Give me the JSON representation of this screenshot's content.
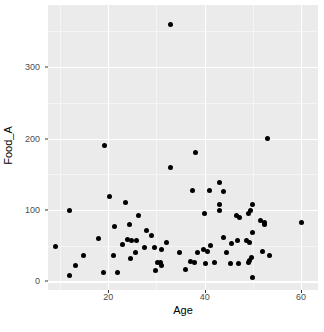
{
  "chart_data": {
    "type": "scatter",
    "title": "",
    "xlabel": "Age",
    "ylabel": "Food_A",
    "xlim": [
      7.5,
      63.5
    ],
    "ylim": [
      -12,
      387
    ],
    "grid": true,
    "legend": null,
    "x_ticks": [
      20,
      40,
      60
    ],
    "y_ticks": [
      0,
      100,
      200,
      300
    ],
    "x_tick_labels": [
      "20",
      "40",
      "60"
    ],
    "y_tick_labels": [
      "0",
      "100",
      "200",
      "300"
    ],
    "x_minor_ticks": [
      10,
      30,
      50
    ],
    "y_minor_ticks": [
      50,
      150,
      250,
      350
    ],
    "point_color": "#000000",
    "panel_color": "#EBEBEB",
    "grid_color": "#FFFFFF",
    "points": [
      {
        "x": 33.0,
        "y": 360
      },
      {
        "x": 53.0,
        "y": 200
      },
      {
        "x": 19.3,
        "y": 190
      },
      {
        "x": 38.0,
        "y": 180
      },
      {
        "x": 33.0,
        "y": 160
      },
      {
        "x": 43.0,
        "y": 138
      },
      {
        "x": 37.5,
        "y": 128
      },
      {
        "x": 41.0,
        "y": 128
      },
      {
        "x": 44.0,
        "y": 126
      },
      {
        "x": 20.2,
        "y": 119
      },
      {
        "x": 50.0,
        "y": 108
      },
      {
        "x": 23.5,
        "y": 110
      },
      {
        "x": 43.0,
        "y": 108
      },
      {
        "x": 12.0,
        "y": 100
      },
      {
        "x": 49.5,
        "y": 100
      },
      {
        "x": 43.0,
        "y": 100
      },
      {
        "x": 26.3,
        "y": 93
      },
      {
        "x": 40.0,
        "y": 95
      },
      {
        "x": 49.0,
        "y": 95
      },
      {
        "x": 46.5,
        "y": 93
      },
      {
        "x": 47.3,
        "y": 90
      },
      {
        "x": 51.5,
        "y": 85
      },
      {
        "x": 52.3,
        "y": 82
      },
      {
        "x": 60.0,
        "y": 82
      },
      {
        "x": 52.3,
        "y": 80
      },
      {
        "x": 24.5,
        "y": 80
      },
      {
        "x": 21.3,
        "y": 77
      },
      {
        "x": 28.0,
        "y": 72
      },
      {
        "x": 50.0,
        "y": 68
      },
      {
        "x": 29.0,
        "y": 65
      },
      {
        "x": 18.0,
        "y": 60
      },
      {
        "x": 24.0,
        "y": 59
      },
      {
        "x": 24.8,
        "y": 57
      },
      {
        "x": 25.8,
        "y": 57
      },
      {
        "x": 44.0,
        "y": 62
      },
      {
        "x": 46.8,
        "y": 58
      },
      {
        "x": 48.7,
        "y": 58
      },
      {
        "x": 49.3,
        "y": 55
      },
      {
        "x": 32.0,
        "y": 55
      },
      {
        "x": 23.0,
        "y": 52
      },
      {
        "x": 9.0,
        "y": 49
      },
      {
        "x": 41.3,
        "y": 50
      },
      {
        "x": 45.5,
        "y": 53
      },
      {
        "x": 27.5,
        "y": 48
      },
      {
        "x": 29.5,
        "y": 47
      },
      {
        "x": 31.0,
        "y": 45
      },
      {
        "x": 39.8,
        "y": 45
      },
      {
        "x": 40.5,
        "y": 42
      },
      {
        "x": 44.5,
        "y": 40
      },
      {
        "x": 25.7,
        "y": 40
      },
      {
        "x": 34.8,
        "y": 40
      },
      {
        "x": 38.5,
        "y": 40
      },
      {
        "x": 52.0,
        "y": 42
      },
      {
        "x": 14.8,
        "y": 37
      },
      {
        "x": 21.0,
        "y": 36
      },
      {
        "x": 53.5,
        "y": 36
      },
      {
        "x": 49.8,
        "y": 34
      },
      {
        "x": 24.7,
        "y": 32
      },
      {
        "x": 49.3,
        "y": 30
      },
      {
        "x": 49.0,
        "y": 27
      },
      {
        "x": 30.3,
        "y": 27
      },
      {
        "x": 30.8,
        "y": 26
      },
      {
        "x": 31.0,
        "y": 23
      },
      {
        "x": 37.0,
        "y": 28
      },
      {
        "x": 37.8,
        "y": 27
      },
      {
        "x": 40.2,
        "y": 25
      },
      {
        "x": 42.0,
        "y": 26
      },
      {
        "x": 45.3,
        "y": 25
      },
      {
        "x": 47.0,
        "y": 25
      },
      {
        "x": 13.3,
        "y": 23
      },
      {
        "x": 36.0,
        "y": 17
      },
      {
        "x": 29.8,
        "y": 16
      },
      {
        "x": 19.0,
        "y": 12
      },
      {
        "x": 22.0,
        "y": 13
      },
      {
        "x": 12.0,
        "y": 8
      },
      {
        "x": 50.0,
        "y": 6
      }
    ]
  },
  "axes": {
    "x_title": "Age",
    "y_title": "Food_A"
  }
}
